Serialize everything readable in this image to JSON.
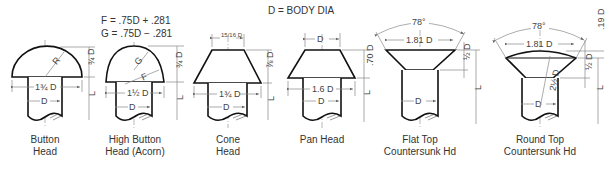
{
  "header": {
    "body_dia_note": "D = BODY DIA",
    "formula_f": "F = .75D + .281",
    "formula_g": "G = .75D − .281"
  },
  "rivets": [
    {
      "id": "button-head",
      "caption_line1": "Button",
      "caption_line2": "Head",
      "dims": {
        "head_width": "1¾ D",
        "head_height": "¾ D",
        "radius": "R",
        "shank": "D",
        "length": "L"
      }
    },
    {
      "id": "high-button-head",
      "caption_line1": "High Button",
      "caption_line2": "Head (Acorn)",
      "dims": {
        "head_width": "1½ D",
        "head_height": "¾ D",
        "radius_f": "F",
        "radius_g": "G",
        "shank": "D",
        "length": "L"
      }
    },
    {
      "id": "cone-head",
      "caption_line1": "Cone",
      "caption_line2": "Head",
      "dims": {
        "top_width": "15/16 D",
        "head_width": "1¾ D",
        "head_height": "⅞ D",
        "shank": "D",
        "length": "L"
      }
    },
    {
      "id": "pan-head",
      "caption_line1": "Pan Head",
      "caption_line2": "",
      "dims": {
        "top_width": "D",
        "head_width": "1.6 D",
        "head_height": ".70 D",
        "shank": "D",
        "length": "L"
      }
    },
    {
      "id": "flat-top-countersunk",
      "caption_line1": "Flat Top",
      "caption_line2": "Countersunk Hd",
      "dims": {
        "angle": "78°",
        "head_width": "1.81 D",
        "head_height": "½ D",
        "shank": "D",
        "length": "L"
      }
    },
    {
      "id": "round-top-countersunk",
      "caption_line1": "Round Top",
      "caption_line2": "Countersunk Hd",
      "dims": {
        "angle": "78°",
        "head_width": "1.81 D",
        "head_height": "½ D",
        "dome_height": ".19 D",
        "dome_radius": "2½ D",
        "shank": "D",
        "length": "L"
      }
    }
  ]
}
